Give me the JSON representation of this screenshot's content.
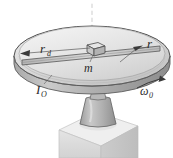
{
  "figure": {
    "background_color": "#ffffff",
    "labels": {
      "disk_radius": {
        "symbol": "r",
        "subscript": "d",
        "full": "r_d"
      },
      "block_mass": {
        "symbol": "m",
        "full": "m"
      },
      "block_radius": {
        "symbol": "r",
        "full": "r"
      },
      "moment_of_inertia": {
        "symbol": "I",
        "subscript": "O",
        "full": "I_O"
      },
      "angular_velocity": {
        "symbol": "ω",
        "subscript": "0",
        "full": "ω_0"
      }
    },
    "parts": {
      "axis": "vertical-dashed-rotation-axis",
      "disk": "rotating-disk",
      "slot": "radial-slot",
      "block": "sliding-block",
      "pedestal": "conical-pedestal",
      "base": "cubic-base-block"
    },
    "colors": {
      "disk_top": "#dcdcdc",
      "disk_top_light": "#efefef",
      "disk_edge": "#bdbdbd",
      "disk_rim_dark": "#9a9a9a",
      "outline": "#4a4a4a",
      "pedestal": "#b5b5b5",
      "base_top": "#eeeeee",
      "base_front": "#dadada",
      "base_side": "#c6c6c6",
      "axis_line": "#cfcfcf",
      "label_text": "#2b2b2b"
    }
  }
}
